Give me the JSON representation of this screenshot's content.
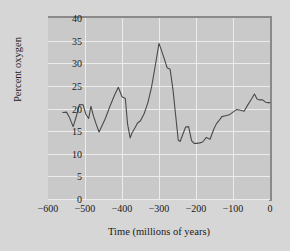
{
  "chart_data": {
    "type": "line",
    "title": "",
    "xlabel": "Time (millions of years)",
    "ylabel": "Percent oxygen",
    "xlim": [
      -600,
      0
    ],
    "ylim": [
      0,
      40
    ],
    "xticks": [
      -600,
      -500,
      -400,
      -300,
      -200,
      -100,
      0
    ],
    "xtick_labels": [
      "−600",
      "−500",
      "−400",
      "−300",
      "−200",
      "−100",
      "0"
    ],
    "yticks": [
      0,
      5,
      10,
      15,
      20,
      25,
      30,
      35,
      40
    ],
    "ytick_labels": [
      "0",
      "5",
      "10",
      "15",
      "20",
      "25",
      "30",
      "35",
      "40"
    ],
    "grid": true,
    "legend": "none",
    "series": [
      {
        "name": "Atmospheric oxygen",
        "color": "#4a4a4a",
        "x": [
          -560,
          -550,
          -543,
          -532,
          -523,
          -515,
          -505,
          -498,
          -490,
          -484,
          -477,
          -470,
          -462,
          -455,
          -445,
          -432,
          -420,
          -410,
          -400,
          -391,
          -385,
          -378,
          -373,
          -366,
          -358,
          -350,
          -340,
          -330,
          -320,
          -310,
          -300,
          -294,
          -287,
          -278,
          -270,
          -262,
          -255,
          -248,
          -243,
          -236,
          -228,
          -220,
          -212,
          -205,
          -198,
          -190,
          -182,
          -172,
          -162,
          -152,
          -145,
          -138,
          -130,
          -120,
          -110,
          -100,
          -90,
          -80,
          -70,
          -60,
          -50,
          -42,
          -35,
          -28,
          -20,
          -12,
          -5,
          0
        ],
        "y": [
          19.1,
          19.2,
          18.2,
          16.0,
          18.4,
          20.9,
          20.8,
          18.8,
          17.8,
          20.5,
          18.3,
          16.6,
          14.8,
          16.0,
          17.8,
          20.6,
          23.0,
          24.7,
          22.6,
          22.2,
          16.6,
          13.5,
          14.6,
          15.6,
          16.8,
          17.3,
          18.9,
          21.3,
          24.8,
          29.5,
          34.4,
          33.0,
          31.3,
          29.0,
          28.7,
          24.0,
          18.5,
          13.0,
          12.7,
          14.2,
          15.9,
          16.0,
          12.9,
          12.3,
          12.3,
          12.4,
          12.6,
          13.6,
          13.2,
          15.4,
          16.6,
          17.3,
          18.2,
          18.4,
          18.6,
          19.2,
          19.8,
          19.6,
          19.4,
          20.8,
          22.1,
          23.2,
          22.1,
          21.9,
          21.9,
          21.4,
          21.3,
          21.3
        ]
      }
    ]
  },
  "style": {
    "plot_bg": "#c9c9c9",
    "figure_bg": "#d6d6d6",
    "grid_color": "#ececec",
    "frame_color": "#8a8a8a",
    "line_color": "#4a4a4a",
    "text_color": "#1a1a1a"
  }
}
